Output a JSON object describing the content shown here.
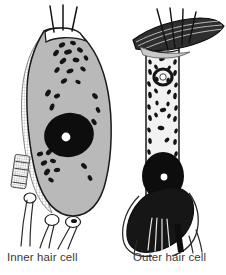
{
  "figure": {
    "background_color": "#ffffff",
    "ink_color": "#1a1a1a",
    "cytoplasm_gray": "#b9b9b9",
    "cytoplasm_light": "#f2f2f2",
    "nucleus_color": "#0d0d0d",
    "nucleolus_color": "#ffffff",
    "membrane_color": "#2b2b2b"
  },
  "cells": [
    {
      "id": "inner-hair-cell",
      "label": "Inner hair cell",
      "shape": "flask",
      "body_fill": "#b9b9b9",
      "stereocilia_count": 3,
      "has_nucleolus": true,
      "nerve_fiber_count": 4,
      "nerve_terminal_count": 3,
      "mitochondria_count": 28,
      "has_supporting_cell_hatching": true,
      "has_tectorial_membrane": false
    },
    {
      "id": "outer-hair-cell",
      "label": "Outer hair cell",
      "shape": "cylindrical",
      "body_fill": "#f2f2f2",
      "stereocilia_count": 4,
      "has_nucleolus": true,
      "nerve_fiber_count": 6,
      "nerve_terminal_count": 1,
      "mitochondria_count": 46,
      "has_supporting_cell_hatching": false,
      "has_tectorial_membrane": true
    }
  ],
  "captions": {
    "left": "Inner hair cell",
    "right": "Outer hair cell"
  }
}
